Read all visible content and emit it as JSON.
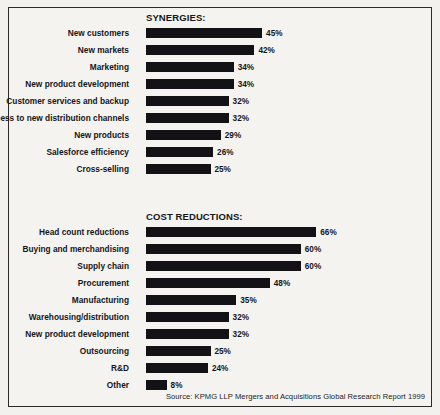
{
  "chart_data": {
    "type": "bar",
    "title": "",
    "orientation": "horizontal",
    "xlabel": "",
    "ylabel": "",
    "xlim": [
      0,
      70
    ],
    "grid": false,
    "legend": null,
    "value_suffix": "%",
    "source": "Source: KPMG LLP Mergers and Acquisitions Global Research Report 1999",
    "panels": [
      {
        "title": "SYNERGIES:",
        "categories": [
          "New customers",
          "New markets",
          "Marketing",
          "New product development",
          "Customer services and backup",
          "Access to new distribution channels",
          "New products",
          "Salesforce efficiency",
          "Cross-selling"
        ],
        "values": [
          45,
          42,
          34,
          34,
          32,
          32,
          29,
          26,
          25
        ],
        "value_labels": [
          "45%",
          "42%",
          "34%",
          "34%",
          "32%",
          "32%",
          "29%",
          "26%",
          "25%"
        ]
      },
      {
        "title": "COST REDUCTIONS:",
        "categories": [
          "Head count reductions",
          "Buying and merchandising",
          "Supply chain",
          "Procurement",
          "Manufacturing",
          "Warehousing/distribution",
          "New product development",
          "Outsourcing",
          "R&D",
          "Other"
        ],
        "values": [
          66,
          60,
          60,
          48,
          35,
          32,
          32,
          25,
          24,
          8
        ],
        "value_labels": [
          "66%",
          "60%",
          "60%",
          "48%",
          "35%",
          "32%",
          "32%",
          "25%",
          "24%",
          "8%"
        ]
      }
    ]
  },
  "colors": {
    "bar": "#131216",
    "text": "#16151a",
    "frame": "#2b2a28",
    "background": "#f4f3f0"
  }
}
